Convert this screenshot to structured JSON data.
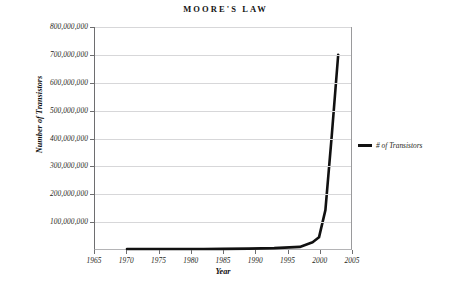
{
  "chart_data": {
    "type": "line",
    "title_plain": "MOORE'S LAW",
    "xlabel": "Year",
    "ylabel": "Number of Transistors",
    "xlim": [
      1965,
      2005
    ],
    "ylim": [
      0,
      800000000
    ],
    "grid": true,
    "legend_position": "right",
    "series": [
      {
        "name": "# of Transistors",
        "color": "#111111",
        "x": [
          1970,
          1972,
          1974,
          1978,
          1982,
          1985,
          1989,
          1993,
          1997,
          1999,
          2000,
          2001,
          2002,
          2003
        ],
        "values": [
          2250,
          3500,
          6000,
          29000,
          134000,
          275000,
          1180000,
          3100000,
          7500000,
          24000000,
          42000000,
          140000000,
          410000000,
          700000000
        ]
      }
    ],
    "x_ticks": [
      {
        "value": 1965,
        "label": "1965"
      },
      {
        "value": 1970,
        "label": "1970"
      },
      {
        "value": 1975,
        "label": "1975"
      },
      {
        "value": 1980,
        "label": "1980"
      },
      {
        "value": 1985,
        "label": "1985"
      },
      {
        "value": 1990,
        "label": "1990"
      },
      {
        "value": 1995,
        "label": "1995"
      },
      {
        "value": 2000,
        "label": "2000"
      },
      {
        "value": 2005,
        "label": "2005"
      }
    ],
    "y_ticks": [
      {
        "value": 800000000,
        "label": "800,000,000"
      },
      {
        "value": 700000000,
        "label": "700,000,000"
      },
      {
        "value": 600000000,
        "label": "600,000,000"
      },
      {
        "value": 500000000,
        "label": "500,000,000"
      },
      {
        "value": 400000000,
        "label": "400,000,000"
      },
      {
        "value": 300000000,
        "label": "300,000,000"
      },
      {
        "value": 200000000,
        "label": "200,000,000"
      },
      {
        "value": 100000000,
        "label": "100,000,000"
      }
    ],
    "colors": {
      "series": "#111111",
      "grid": "#d7d7d9",
      "axis": "#6e6e70",
      "text": "#1f1f21",
      "background": "#ffffff"
    }
  },
  "legend": {
    "entries": [
      {
        "label": "# of Transistors",
        "color": "#111111"
      }
    ]
  }
}
